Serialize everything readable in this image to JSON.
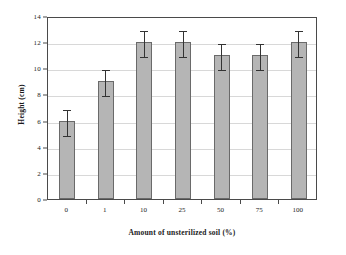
{
  "chart_data": {
    "type": "bar",
    "title": "",
    "xlabel": "Amount of unsterilized soil (%)",
    "ylabel": "Height (cm)",
    "categories": [
      "0",
      "1",
      "10",
      "25",
      "50",
      "75",
      "100"
    ],
    "values": [
      6,
      9,
      12,
      12,
      11,
      11,
      12
    ],
    "errors_low": [
      5,
      8,
      11,
      11,
      10,
      10,
      11
    ],
    "errors_high": [
      7,
      10,
      13,
      13,
      12,
      12,
      13
    ],
    "error_margins": [
      1,
      1,
      1,
      1,
      1,
      1,
      1
    ],
    "ylim": [
      0,
      14
    ],
    "yticks": [
      0,
      2,
      4,
      6,
      8,
      10,
      12,
      14
    ],
    "ytick_labels": [
      "0",
      "2",
      "4",
      "6",
      "8",
      "10",
      "12",
      "14"
    ],
    "grid": true,
    "grid_axis": "y",
    "legend": false,
    "bar_color": "#b5b5b5",
    "bar_edge_color": "#6a6a6a",
    "error_color": "#333333",
    "axis_color": "#4a4a4a",
    "grid_color": "#d8d8d8",
    "background": "#ffffff"
  }
}
